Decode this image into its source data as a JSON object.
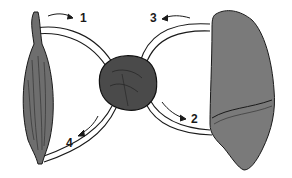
{
  "diagram": {
    "type": "circulation-schematic",
    "organs": [
      {
        "id": "muscle",
        "name": "Muscle",
        "position": "left"
      },
      {
        "id": "heart",
        "name": "Heart",
        "position": "center"
      },
      {
        "id": "lung",
        "name": "Lung",
        "position": "right"
      }
    ],
    "arrows": [
      {
        "label": "1",
        "from": "muscle",
        "to": "heart",
        "path": "upper-left vessel"
      },
      {
        "label": "2",
        "from": "heart",
        "to": "lung",
        "path": "lower-right vessel"
      },
      {
        "label": "3",
        "from": "lung",
        "to": "heart",
        "path": "upper-right vessel"
      },
      {
        "label": "4",
        "from": "heart",
        "to": "muscle",
        "path": "lower-left vessel"
      }
    ],
    "colors": {
      "outline": "#1a1a1a",
      "muscle_fill": "#6e6e6e",
      "heart_fill": "#4a4a4a",
      "lung_fill": "#7a7a7a",
      "background": "#ffffff"
    }
  }
}
